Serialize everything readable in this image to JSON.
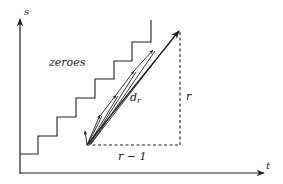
{
  "diagram": {
    "axes": {
      "y_label": "s",
      "x_label": "t"
    },
    "labels": {
      "region": "zeroes",
      "diagonal": "d",
      "diagonal_sub": "r",
      "vertical_leg": "r",
      "horizontal_leg": "r − 1"
    },
    "colors": {
      "stroke": "#222222",
      "background": "#ffffff"
    }
  }
}
